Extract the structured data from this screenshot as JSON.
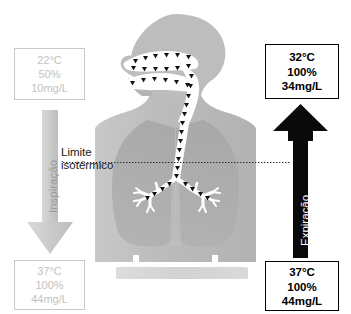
{
  "figure": {
    "background_color": "#ffffff",
    "gray_accent": "#c2c2c2",
    "black_accent": "#000000",
    "body_fill": "#bdbdbd",
    "lung_fill": "#a8a8a8",
    "airway_fill": "#ffffff"
  },
  "boxes": {
    "inspired_air_in": {
      "name": "inspired-air-inlet-values",
      "temperature": "22°C",
      "humidity": "50%",
      "absolute_humidity": "10mg/L",
      "style": "gray"
    },
    "expired_air_out": {
      "name": "expired-air-outlet-values",
      "temperature": "32°C",
      "humidity": "100%",
      "absolute_humidity": "34mg/L",
      "style": "black"
    },
    "inspired_air_alveolar": {
      "name": "inspired-air-alveolar-values",
      "temperature": "37°C",
      "humidity": "100%",
      "absolute_humidity": "44mg/L",
      "style": "gray"
    },
    "expired_air_alveolar": {
      "name": "expired-air-alveolar-values",
      "temperature": "37°C",
      "humidity": "100%",
      "absolute_humidity": "44mg/L",
      "style": "black"
    }
  },
  "labels": {
    "inspiration": "Inspiração",
    "expiration": "Expiração",
    "isothermic_line_1": "Limite",
    "isothermic_line_2": "isotérmico"
  },
  "arrows": {
    "inspiration": {
      "name": "inspiration-arrow",
      "direction": "down",
      "color": "#cfcfcf"
    },
    "expiration": {
      "name": "expiration-arrow",
      "direction": "up",
      "color": "#000000"
    }
  },
  "anatomy": {
    "head": "head-silhouette",
    "nasal_cavity": "nasal-cavity",
    "oral_cavity": "oral-cavity",
    "trachea": "trachea",
    "bronchi": "bronchial-tree",
    "lungs": "lung-field",
    "torso": "torso-silhouette",
    "base_bar": "base-bar",
    "flow_markers": "airflow-triangle-markers"
  }
}
